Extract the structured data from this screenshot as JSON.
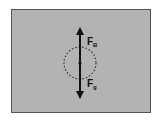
{
  "diagram": {
    "labels": {
      "top_force": "F",
      "top_force_sub": "B",
      "bottom_force": "F",
      "bottom_force_sub": "g"
    },
    "colors": {
      "background": "#b3b3b3",
      "arrow": "#111111",
      "circle": "#333333"
    }
  }
}
